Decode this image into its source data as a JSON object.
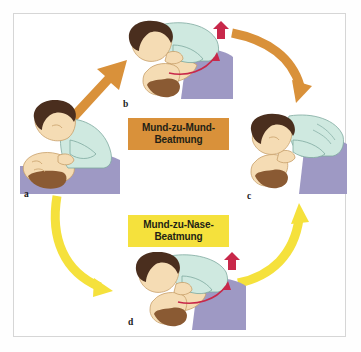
{
  "figure": {
    "kind": "first-aid-instruction-diagram",
    "language": "German",
    "cycle_labels": [
      "a",
      "b",
      "c",
      "d"
    ]
  },
  "labels": {
    "mouth_to_mouth": {
      "line1": "Mund-zu-Mund-",
      "line2": "Beatmung",
      "bg": "#d9913a"
    },
    "mouth_to_nose": {
      "line1": "Mund-zu-Nase-",
      "line2": "Beatmung",
      "bg": "#f5e13c"
    }
  },
  "panels": [
    {
      "id": "a",
      "letter": "a",
      "caption_letter": "a"
    },
    {
      "id": "b",
      "letter": "b",
      "caption_letter": "b"
    },
    {
      "id": "c",
      "letter": "c",
      "caption_letter": "c"
    },
    {
      "id": "d",
      "letter": "d",
      "caption_letter": "d"
    }
  ],
  "arrows": [
    {
      "id": "a-to-b",
      "color": "#d9913a"
    },
    {
      "id": "b-to-c",
      "color": "#d9913a"
    },
    {
      "id": "a-to-d",
      "color": "#f5e13c"
    },
    {
      "id": "d-to-c",
      "color": "#f5e13c"
    }
  ],
  "colors": {
    "orange": "#d9913a",
    "yellow": "#f5e13c",
    "shirt": "#cfe9e0",
    "hair": "#4a2e1e",
    "hair_victim": "#8a5a33",
    "skin": "#f5dcb4",
    "bed": "#9e99c4",
    "red_arrow": "#c8284a",
    "frame": "#d6d6d6"
  }
}
